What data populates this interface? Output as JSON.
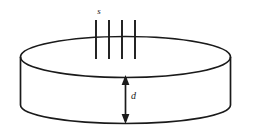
{
  "figure": {
    "kind": "line-diagram",
    "background_color": "#ffffff",
    "stroke_color": "#1a1a1a",
    "labels": {
      "spacing_label": "s",
      "thickness_label": "d"
    },
    "geometry": {
      "canvas_width": 253,
      "canvas_height": 139,
      "top_ellipse": {
        "center_x": 125.5,
        "center_y": 57.0,
        "radius_x": 105.0,
        "radius_y": 20.5
      },
      "bottom_ellipse": {
        "center_x": 125.5,
        "center_y": 105.0,
        "radius_x": 105.0,
        "radius_y": 18.5
      },
      "side_wall_left_x": 20.5,
      "side_wall_right_x": 230.5,
      "side_wall_top_y": 57.0,
      "side_wall_bottom_y": 105.0,
      "hatch_lines_x": [
        96,
        109,
        122,
        135
      ],
      "hatch_line_top_y": 20,
      "hatch_line_bottom_y": 59,
      "dimension_arrow_x": 125.5,
      "dimension_arrow_top_y": 76,
      "dimension_arrow_bottom_y": 123,
      "label_s_x": 99,
      "label_s_y": 14,
      "label_d_x": 122,
      "label_d_y": 99
    }
  }
}
